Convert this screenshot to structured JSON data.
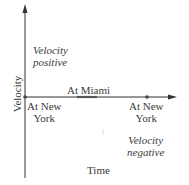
{
  "diagram": {
    "y_axis_label": "Velocity",
    "x_axis_label": "Time",
    "region_labels": {
      "positive": [
        "Velocity",
        "positive"
      ],
      "negative": [
        "Velocity",
        "negative"
      ]
    },
    "points": [
      {
        "label_line1": "At New",
        "label_line2": "York",
        "position": "origin"
      },
      {
        "label": "At Miami",
        "position": "middle segment on axis"
      },
      {
        "label_line1": "At New",
        "label_line2": "York",
        "position": "right dot on axis"
      }
    ],
    "colors": {
      "axis": "#333333",
      "text": "#3a3a3a",
      "segment": "#555555"
    }
  }
}
